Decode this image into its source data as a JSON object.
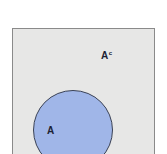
{
  "diagram": {
    "type": "venn",
    "universe": {
      "fill": "#e7e7e6",
      "border": "#8a8a8a"
    },
    "sets": [
      {
        "label": "A",
        "fill": "#a0b6e8",
        "stroke": "#3a4256"
      }
    ],
    "complement_label": {
      "base": "A",
      "superscript": "c"
    }
  }
}
